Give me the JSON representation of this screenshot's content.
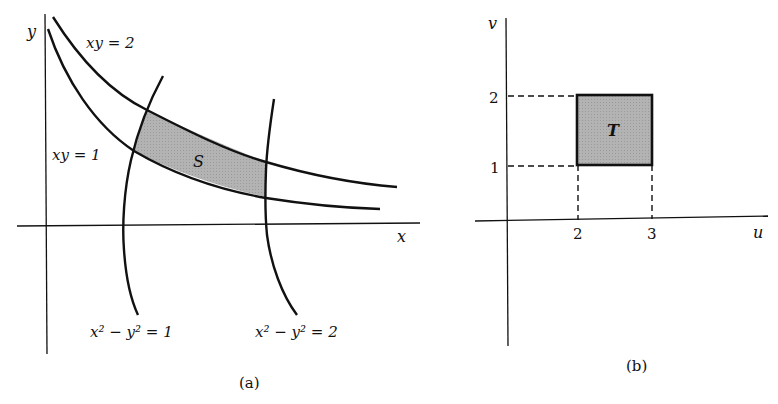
{
  "figure": {
    "panel_a": {
      "caption": "(a)",
      "axis_x_label": "x",
      "axis_y_label": "y",
      "curves": [
        {
          "name": "xy = 2",
          "label": "xy = 2"
        },
        {
          "name": "xy = 1",
          "label": "xy = 1"
        },
        {
          "name": "x² − y² = 1",
          "label_main": "x² − y² = 1"
        },
        {
          "name": "x² − y² = 2",
          "label_main": "x² − y² = 2"
        }
      ],
      "region_label": "S",
      "region_fill": "#b0b0b0"
    },
    "panel_b": {
      "caption": "(b)",
      "axis_u_label": "u",
      "axis_v_label": "v",
      "u_ticks": [
        "2",
        "3"
      ],
      "v_ticks": [
        "1",
        "2"
      ],
      "region_label": "T",
      "region_fill": "#b0b0b0",
      "region_bounds": {
        "u_min": 2,
        "u_max": 3,
        "v_min": 1,
        "v_max": 2
      }
    }
  }
}
